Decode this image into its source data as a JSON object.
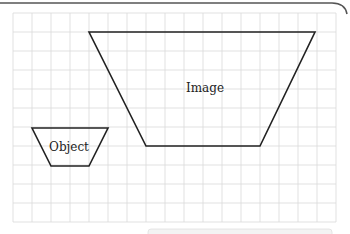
{
  "diagram": {
    "grid": {
      "origin_x": 13,
      "origin_y": 13,
      "cell": 19,
      "cols": 17,
      "rows": 11,
      "color": "#d9d9d9"
    },
    "shapes": [
      {
        "name": "image",
        "label": "Image",
        "points": [
          [
            89,
            32
          ],
          [
            315,
            32
          ],
          [
            260,
            146
          ],
          [
            146,
            146
          ]
        ]
      },
      {
        "name": "object",
        "label": "Object",
        "points": [
          [
            32,
            128
          ],
          [
            108,
            128
          ],
          [
            89,
            166
          ],
          [
            51,
            166
          ]
        ]
      }
    ],
    "labels": {
      "image": "Image",
      "object": "Object"
    },
    "colors": {
      "stroke": "#222222",
      "frame": "#555555",
      "bottom_box": "#e8e8e8"
    }
  }
}
